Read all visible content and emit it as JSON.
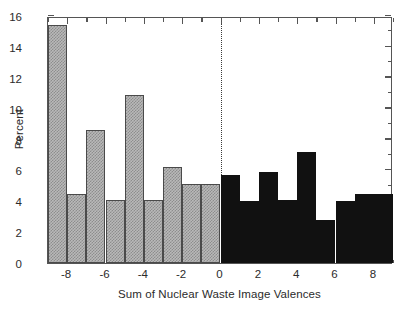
{
  "chart_data": {
    "type": "bar",
    "title": "",
    "xlabel": "Sum of Nuclear Waste Image Valences",
    "ylabel": "Percent",
    "xlim": [
      -9,
      9
    ],
    "ylim": [
      0,
      16
    ],
    "bin_width": 1,
    "grid": false,
    "legend": null,
    "annotations": [
      {
        "name": "zero-reference-line",
        "type": "vline",
        "x": 0,
        "style": "dotted"
      }
    ],
    "xticks": [
      -8,
      -6,
      -4,
      -2,
      0,
      2,
      4,
      6,
      8
    ],
    "xtick_labels": [
      "-8",
      "-6",
      "-4",
      "-2",
      "0",
      "2",
      "4",
      "6",
      "8"
    ],
    "xticks_minor": [
      -9,
      -7,
      -5,
      -3,
      -1,
      1,
      3,
      5,
      7,
      9
    ],
    "yticks": [
      0,
      2,
      4,
      6,
      8,
      10,
      12,
      14,
      16
    ],
    "ytick_labels": [
      "0",
      "2",
      "4",
      "6",
      "8",
      "10",
      "12",
      "14",
      "16"
    ],
    "yticks_minor": [
      1,
      3,
      5,
      7,
      9,
      11,
      13,
      15
    ],
    "bins": [
      {
        "x0": -9,
        "x1": -8,
        "value": 15.4,
        "fill": "hatched-gray"
      },
      {
        "x0": -8,
        "x1": -7,
        "value": 4.5,
        "fill": "hatched-gray"
      },
      {
        "x0": -7,
        "x1": -6,
        "value": 8.6,
        "fill": "hatched-gray"
      },
      {
        "x0": -6,
        "x1": -5,
        "value": 4.1,
        "fill": "hatched-gray"
      },
      {
        "x0": -5,
        "x1": -4,
        "value": 10.9,
        "fill": "hatched-gray"
      },
      {
        "x0": -4,
        "x1": -3,
        "value": 4.1,
        "fill": "hatched-gray"
      },
      {
        "x0": -3,
        "x1": -2,
        "value": 6.2,
        "fill": "hatched-gray"
      },
      {
        "x0": -2,
        "x1": -1,
        "value": 5.1,
        "fill": "hatched-gray"
      },
      {
        "x0": -1,
        "x1": 0,
        "value": 5.1,
        "fill": "hatched-gray"
      },
      {
        "x0": 0,
        "x1": 1,
        "value": 5.7,
        "fill": "solid-black"
      },
      {
        "x0": 1,
        "x1": 2,
        "value": 4.0,
        "fill": "solid-black"
      },
      {
        "x0": 2,
        "x1": 3,
        "value": 5.9,
        "fill": "solid-black"
      },
      {
        "x0": 3,
        "x1": 4,
        "value": 4.1,
        "fill": "solid-black"
      },
      {
        "x0": 4,
        "x1": 5,
        "value": 7.2,
        "fill": "solid-black"
      },
      {
        "x0": 5,
        "x1": 6,
        "value": 2.8,
        "fill": "solid-black"
      },
      {
        "x0": 6,
        "x1": 7,
        "value": 4.0,
        "fill": "solid-black"
      },
      {
        "x0": 7,
        "x1": 8,
        "value": 4.5,
        "fill": "solid-black"
      },
      {
        "x0": 8,
        "x1": 9,
        "value": 4.5,
        "fill": "solid-black"
      }
    ],
    "colors": {
      "negative_fill": "#b9b9b9",
      "negative_hatch": "#8d8d8d",
      "negative_edge": "#4a4a4a",
      "positive_fill": "#111111",
      "axis": "#555555",
      "text": "#2b2b2b",
      "background": "#ffffff"
    }
  }
}
